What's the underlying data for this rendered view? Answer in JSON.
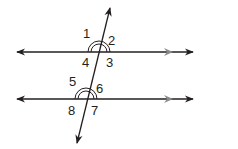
{
  "diagram": {
    "angle_labels": [
      "1",
      "2",
      "3",
      "4",
      "5",
      "6",
      "7",
      "8"
    ],
    "colors": {
      "line": "#231f20",
      "parallel_marker": "#8a8a8a",
      "background": "#ffffff"
    }
  }
}
